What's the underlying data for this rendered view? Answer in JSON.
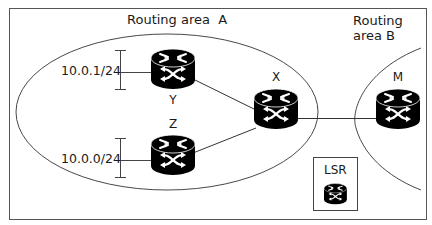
{
  "diagram": {
    "areas": {
      "a": {
        "label": "Routing area  A"
      },
      "b": {
        "label_line1": "Routing",
        "label_line2": "area B"
      }
    },
    "subnets": [
      {
        "label": "10.0.1/24",
        "attached_to": "Y"
      },
      {
        "label": "10.0.0/24",
        "attached_to": "Z"
      }
    ],
    "nodes": [
      {
        "id": "Y",
        "label": "Y",
        "type": "router-icon"
      },
      {
        "id": "Z",
        "label": "Z",
        "type": "router-icon"
      },
      {
        "id": "X",
        "label": "X",
        "type": "router-icon"
      },
      {
        "id": "M",
        "label": "M",
        "type": "router-icon"
      }
    ],
    "links": [
      {
        "from": "Y",
        "to": "X"
      },
      {
        "from": "Z",
        "to": "X"
      },
      {
        "from": "X",
        "to": "M"
      }
    ],
    "legend": {
      "label": "LSR",
      "icon": "router-icon"
    },
    "colors": {
      "stroke": "#333333",
      "router_fill": "#000000",
      "router_glyph": "#ffffff",
      "frame": "#555555"
    }
  }
}
